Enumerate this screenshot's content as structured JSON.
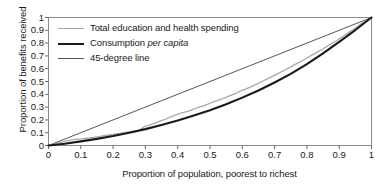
{
  "chart_data": {
    "type": "line",
    "title": "",
    "xlabel": "Proportion of population, poorest to richest",
    "ylabel": "Proportion of benefits received",
    "xlim": [
      0,
      1
    ],
    "ylim": [
      0,
      1
    ],
    "grid": false,
    "legend_position": "upper-left-inside",
    "xticks": [
      "0",
      "0.1",
      "0.2",
      "0.3",
      "0.4",
      "0.5",
      "0.6",
      "0.7",
      "0.8",
      "0.9",
      "1"
    ],
    "yticks": [
      "0",
      "0.1",
      "0.2",
      "0.3",
      "0.4",
      "0.5",
      "0.6",
      "0.7",
      "0.8",
      "0.9",
      "1"
    ],
    "xtick_values": [
      0,
      0.1,
      0.2,
      0.3,
      0.4,
      0.5,
      0.6,
      0.7,
      0.8,
      0.9,
      1
    ],
    "ytick_values": [
      0,
      0.1,
      0.2,
      0.3,
      0.4,
      0.5,
      0.6,
      0.7,
      0.8,
      0.9,
      1
    ],
    "series": [
      {
        "name": "Total education and health spending",
        "color": "#a8a8a8",
        "width": 1.3,
        "x": [
          0,
          0.02,
          0.05,
          0.08,
          0.1,
          0.12,
          0.14,
          0.16,
          0.18,
          0.2,
          0.22,
          0.24,
          0.26,
          0.28,
          0.29,
          0.3,
          0.31,
          0.33,
          0.35,
          0.36,
          0.37,
          0.39,
          0.41,
          0.42,
          0.44,
          0.46,
          0.47,
          0.49,
          0.51,
          0.52,
          0.54,
          0.56,
          0.58,
          0.6,
          0.61,
          0.63,
          0.65,
          0.67,
          0.69,
          0.71,
          0.73,
          0.75,
          0.77,
          0.79,
          0.81,
          0.83,
          0.85,
          0.87,
          0.89,
          0.91,
          0.93,
          0.95,
          0.97,
          1.0
        ],
        "y": [
          0,
          0.012,
          0.032,
          0.048,
          0.052,
          0.058,
          0.064,
          0.072,
          0.08,
          0.086,
          0.094,
          0.102,
          0.11,
          0.118,
          0.135,
          0.152,
          0.158,
          0.175,
          0.196,
          0.202,
          0.215,
          0.236,
          0.252,
          0.258,
          0.274,
          0.295,
          0.302,
          0.32,
          0.34,
          0.348,
          0.366,
          0.388,
          0.408,
          0.432,
          0.44,
          0.462,
          0.486,
          0.512,
          0.536,
          0.562,
          0.588,
          0.614,
          0.642,
          0.668,
          0.698,
          0.726,
          0.756,
          0.786,
          0.816,
          0.85,
          0.884,
          0.918,
          0.954,
          1.0
        ]
      },
      {
        "name": "Consumption per capita",
        "color": "#1a1a1a",
        "width": 2.1,
        "x": [
          0,
          0.05,
          0.1,
          0.15,
          0.2,
          0.25,
          0.3,
          0.35,
          0.4,
          0.45,
          0.5,
          0.55,
          0.6,
          0.65,
          0.7,
          0.75,
          0.8,
          0.85,
          0.9,
          0.95,
          1.0
        ],
        "y": [
          0,
          0.014,
          0.032,
          0.052,
          0.074,
          0.1,
          0.128,
          0.16,
          0.195,
          0.234,
          0.276,
          0.322,
          0.374,
          0.43,
          0.492,
          0.56,
          0.636,
          0.72,
          0.81,
          0.902,
          1.0
        ]
      },
      {
        "name": "45-degree line",
        "color": "#555555",
        "width": 1.0,
        "x": [
          0,
          1
        ],
        "y": [
          0,
          1
        ]
      }
    ]
  },
  "legend": {
    "items": [
      {
        "label": "Total education and health spending",
        "italic_part": "",
        "color": "#a8a8a8",
        "width": 1.3
      },
      {
        "label": "Consumption ",
        "italic_part": "per capita",
        "color": "#1a1a1a",
        "width": 2.1
      },
      {
        "label": "45-degree line",
        "italic_part": "",
        "color": "#555555",
        "width": 1.0
      }
    ]
  },
  "axes": {
    "frame_color": "#8a8a8a",
    "tick_color": "#6a6a6a",
    "text_color": "#1a1a1a"
  }
}
